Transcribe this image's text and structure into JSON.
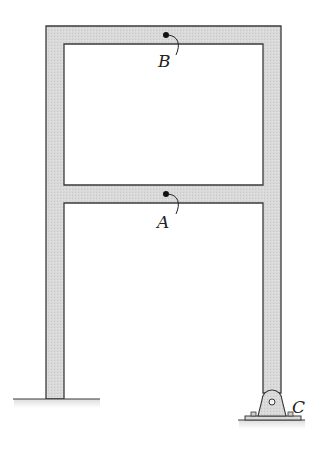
{
  "figure": {
    "type": "two-story frame",
    "colors": {
      "member_fill": "#d9d9d9",
      "member_stroke": "#3a3a3a",
      "ground_shade": "#e6e6e6",
      "point": "#111111"
    }
  },
  "points": {
    "A": {
      "label": "A",
      "location": "mid-span of lower beam"
    },
    "B": {
      "label": "B",
      "location": "mid-span of top beam"
    },
    "C": {
      "label": "C",
      "location": "pin support at base of right column"
    }
  },
  "supports": {
    "left": {
      "type": "fixed"
    },
    "right": {
      "type": "pin",
      "label": "C"
    }
  }
}
